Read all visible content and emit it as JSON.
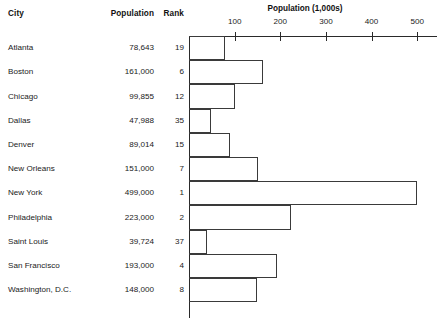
{
  "table": {
    "headers": {
      "city": "City",
      "population": "Population",
      "rank": "Rank"
    },
    "rows": [
      {
        "city": "Atlanta",
        "population": "78,643",
        "rank": "19"
      },
      {
        "city": "Boston",
        "population": "161,000",
        "rank": "6"
      },
      {
        "city": "Chicago",
        "population": "99,855",
        "rank": "12"
      },
      {
        "city": "Dallas",
        "population": "47,988",
        "rank": "35"
      },
      {
        "city": "Denver",
        "population": "89,014",
        "rank": "15"
      },
      {
        "city": "New Orleans",
        "population": "151,000",
        "rank": "7"
      },
      {
        "city": "New York",
        "population": "499,000",
        "rank": "1"
      },
      {
        "city": "Philadelphia",
        "population": "223,000",
        "rank": "2"
      },
      {
        "city": "Saint Louis",
        "population": "39,724",
        "rank": "37"
      },
      {
        "city": "San Francisco",
        "population": "193,000",
        "rank": "4"
      },
      {
        "city": "Washington, D.C.",
        "population": "148,000",
        "rank": "8"
      }
    ]
  },
  "chart_data": {
    "type": "bar",
    "orientation": "horizontal",
    "title": "Population (1,000s)",
    "xlabel": "Population (1,000s)",
    "ylabel": "City",
    "categories": [
      "Atlanta",
      "Boston",
      "Chicago",
      "Dallas",
      "Denver",
      "New Orleans",
      "New York",
      "Philadelphia",
      "Saint Louis",
      "San Francisco",
      "Washington, D.C."
    ],
    "values": [
      78.643,
      161.0,
      99.855,
      47.988,
      89.014,
      151.0,
      499.0,
      223.0,
      39.724,
      193.0,
      148.0
    ],
    "xlim": [
      0,
      543
    ],
    "xticks": [
      100,
      200,
      300,
      400,
      500
    ],
    "xtick_labels": [
      "100",
      "200",
      "300",
      "400",
      "500"
    ],
    "grid": false,
    "legend": false,
    "bar_fill": "#ffffff",
    "bar_edge": "#3a3a3a",
    "axis_color": "#2a2a2a",
    "axis_position": "top"
  },
  "style": {
    "background": "#ffffff",
    "text_color": "#1b1b1b"
  }
}
